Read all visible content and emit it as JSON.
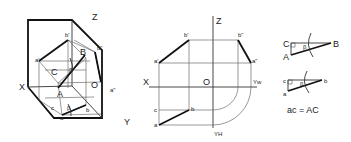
{
  "figure": {
    "panels": [
      {
        "name": "isometric-view",
        "labels": {
          "z": "Z",
          "x": "X",
          "y": "Y",
          "origin": "O",
          "A": "A",
          "B": "B",
          "C": "C",
          "a": "a",
          "b": "b",
          "c": "c",
          "a_prime": "a'",
          "b_prime": "b'",
          "a_dprime": "a\"",
          "b_dprime": "b\"",
          "beta": "β"
        }
      },
      {
        "name": "orthographic-projection",
        "labels": {
          "z": "Z",
          "x": "X",
          "origin": "O",
          "yw": "Yw",
          "yh": "YH",
          "a": "a",
          "b": "b",
          "c": "c",
          "a_prime": "a'",
          "b_prime": "b'",
          "a_dprime": "a\"",
          "b_dprime": "b\""
        }
      },
      {
        "name": "true-length-triangles",
        "labels": {
          "C": "C",
          "A": "A",
          "B": "B",
          "beta_upper": "β",
          "c": "c",
          "a": "a",
          "b": "b",
          "beta_lower": "β",
          "equation": "ac = AC"
        }
      }
    ]
  }
}
